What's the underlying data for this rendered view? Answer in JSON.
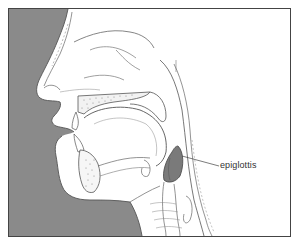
{
  "diagram": {
    "type": "anatomical-sagittal-section",
    "labels": [
      {
        "text": "epiglottis",
        "target": "epiglottis",
        "x": 222,
        "y": 159
      }
    ],
    "colors": {
      "background_shade": "#8a8a8a",
      "epiglottis_fill": "#7a7a7a",
      "frame": "#444444",
      "line": "#555555",
      "paper": "#ffffff"
    },
    "frame": {
      "x": 8,
      "y": 8,
      "width": 283,
      "height": 229
    }
  }
}
